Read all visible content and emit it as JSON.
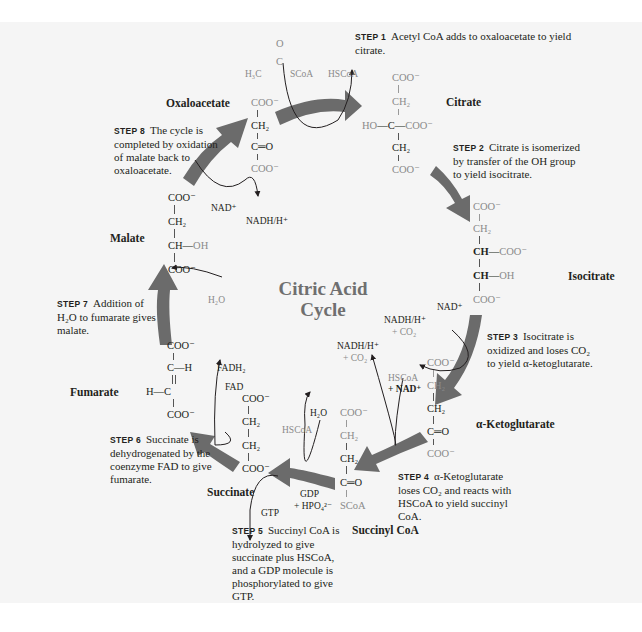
{
  "diagram": {
    "title_line1": "Citric Acid",
    "title_line2": "Cycle",
    "colors": {
      "arrow": "#6b6b6b",
      "grey_text": "#8a8a8a",
      "black_text": "#231f20",
      "background": "#f5f5f5"
    },
    "compounds": {
      "oxaloacetate": "Oxaloacetate",
      "citrate": "Citrate",
      "isocitrate": "Isocitrate",
      "ketoglutarate": "α-Ketoglutarate",
      "succinyl_coa": "Succinyl CoA",
      "succinate": "Succinate",
      "fumarate": "Fumarate",
      "malate": "Malate"
    },
    "steps": [
      {
        "label": "STEP 1",
        "text": "Acetyl CoA adds to oxaloacetate to yield citrate."
      },
      {
        "label": "STEP 2",
        "text": "Citrate is isom­erized by transfer of the OH group to yield isocitrate."
      },
      {
        "label": "STEP 3",
        "text": "Isocitrate is oxidized and loses CO₂ to yield α-ketoglutarate."
      },
      {
        "label": "STEP 4",
        "text": "α-Ketoglutarate loses CO₂ and reacts with HSCoA to yield succinyl CoA."
      },
      {
        "label": "STEP 5",
        "text": "Succinyl CoA is hydrolyzed to give succinate plus HSCoA, and a GDP molecule is phosphorylated to give GTP."
      },
      {
        "label": "STEP 6",
        "text": "Succinate is dehydrogenated by the coenzyme FAD to give fumarate."
      },
      {
        "label": "STEP 7",
        "text": "Addition of H₂O to fuma­rate gives malate."
      },
      {
        "label": "STEP 8",
        "text": "The cycle is completed by oxida­tion of malate back to oxaloacetate."
      }
    ],
    "cofactors": {
      "acetyl_o": "O",
      "acetyl_c": "C",
      "acetyl_h3c": "H₃C",
      "acetyl_scoa": "SCoA",
      "hscoa_1": "HSCoA",
      "nad_8": "NAD⁺",
      "nadh_8": "NADH/H⁺",
      "nad_3": "NAD⁺",
      "nadh_3": "NADH/H⁺",
      "co2_3": "+ CO₂",
      "nadh_4": "NADH/H⁺",
      "co2_4": "+ CO₂",
      "hscoa_4": "HSCoA",
      "nad_4": "+ NAD⁺",
      "hscoa_5": "HSCoA",
      "h2o_5": "H₂O",
      "gdp_5": "GDP",
      "hpo4_5": "+ HPO₄²⁻",
      "gtp_5": "GTP",
      "fadh2_6": "FADH₂",
      "fad_6": "FAD",
      "h2o_7": "H₂O"
    },
    "structures": {
      "coo": "COO⁻",
      "ch2": "CH₂",
      "c_eq_o": "C═O",
      "ch": "CH",
      "oh": "OH",
      "ho": "HO",
      "c": "C",
      "h": "H",
      "scoa": "SCoA",
      "dash": "—"
    }
  }
}
